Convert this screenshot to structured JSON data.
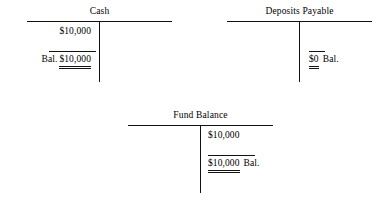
{
  "figure": {
    "kind": "t-account-diagram",
    "background_color": "#ffffff",
    "ink_color": "#111111"
  },
  "accounts": [
    {
      "id": "cash",
      "title": "Cash",
      "debit_entries": [
        {
          "amount": "$10,000",
          "label": "",
          "underline": "none"
        }
      ],
      "debit_balance": {
        "label": "Bal.",
        "label_side": "left",
        "amount": "$10,000",
        "underline": "double",
        "rule_above": true
      },
      "credit_entries": [],
      "credit_balance": null
    },
    {
      "id": "deposits-payable",
      "title": "Deposits Payable",
      "debit_entries": [],
      "debit_balance": null,
      "credit_entries": [],
      "credit_balance": {
        "label": "Bal.",
        "label_side": "right",
        "amount": "$0",
        "underline": "double",
        "rule_above": true
      }
    },
    {
      "id": "fund-balance",
      "title": "Fund Balance",
      "debit_entries": [],
      "debit_balance": null,
      "credit_entries": [
        {
          "amount": "$10,000",
          "label": "",
          "underline": "none"
        }
      ],
      "credit_balance": {
        "label": "Bal.",
        "label_side": "right",
        "amount": "$10,000",
        "underline": "double",
        "rule_above": true
      }
    }
  ]
}
